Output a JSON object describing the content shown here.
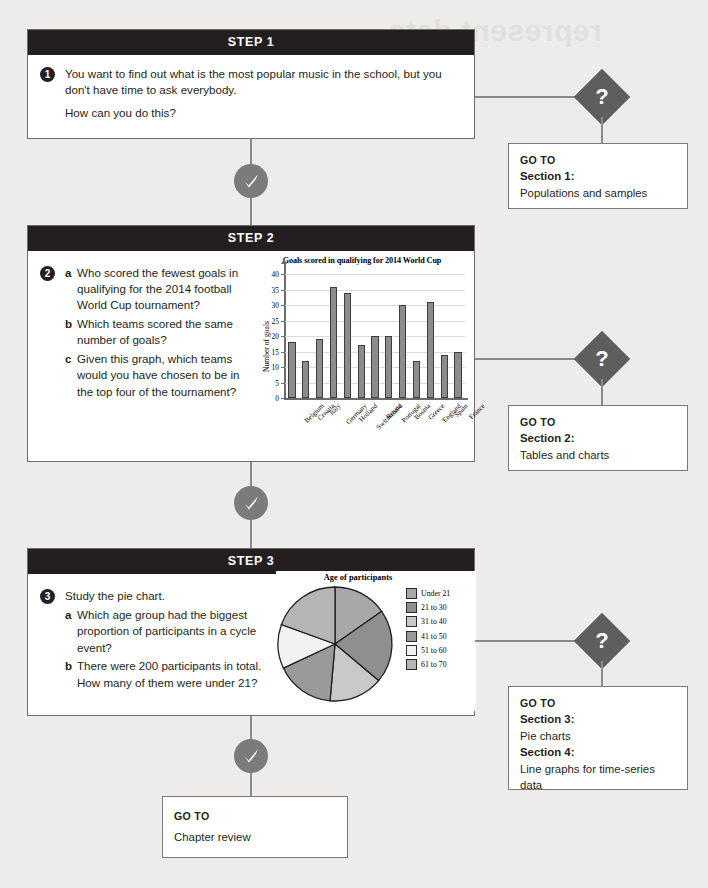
{
  "ghost": {
    "title": "represent data"
  },
  "steps": [
    {
      "header": "STEP 1",
      "number": "1",
      "paragraphs": [
        "You want to find out what is the most popular music in the school, but you don't have time to ask everybody.",
        "How can you do this?"
      ],
      "items": []
    },
    {
      "header": "STEP 2",
      "number": "2",
      "paragraphs": [],
      "items": [
        {
          "label": "a",
          "text": "Who scored the fewest goals in qualifying for the 2014 football World Cup tournament?"
        },
        {
          "label": "b",
          "text": "Which teams scored the same number of goals?"
        },
        {
          "label": "c",
          "text": "Given this graph, which teams would you have chosen to be in the top four of the tournament?"
        }
      ]
    },
    {
      "header": "STEP 3",
      "number": "3",
      "paragraphs": [
        "Study the pie chart."
      ],
      "items": [
        {
          "label": "a",
          "text": "Which age group had the biggest proportion of participants in a cycle event?"
        },
        {
          "label": "b",
          "text": "There were 200 participants in total. How many of them were under 21?"
        }
      ]
    }
  ],
  "goto_boxes": [
    {
      "label": "GO TO",
      "lines": [
        {
          "section": "Section 1:",
          "detail": "Populations and samples"
        }
      ]
    },
    {
      "label": "GO TO",
      "lines": [
        {
          "section": "Section 2:",
          "detail": "Tables and charts"
        }
      ]
    },
    {
      "label": "GO TO",
      "lines": [
        {
          "section": "Section 3:",
          "detail": "Pie charts"
        },
        {
          "section": "Section 4:",
          "detail": "Line graphs for time-series data"
        }
      ]
    }
  ],
  "final_box": {
    "label": "GO TO",
    "detail": "Chapter review"
  },
  "diamond_glyph": "?",
  "colors": {
    "page_bg": "#edecea",
    "header_bg": "#231f20",
    "check_circle": "#7b7b7b",
    "diamond": "#5e5e5e",
    "connector": "#8a8a8a",
    "bar_fill": "#8c8c8c",
    "bar_stroke": "#3d3d3d"
  },
  "chart_data": [
    {
      "type": "bar",
      "title": "Goals scored in qualifying for 2014 World Cup",
      "xlabel": "",
      "ylabel": "Number of goals",
      "categories": [
        "Belgium",
        "Croatia",
        "Italy",
        "Germany",
        "Holland",
        "Switzerland",
        "Russia",
        "Portugal",
        "Bosnia",
        "Greece",
        "England",
        "Spain",
        "France"
      ],
      "values": [
        18,
        12,
        19,
        36,
        34,
        17,
        20,
        20,
        30,
        12,
        31,
        14,
        15
      ],
      "yticks": [
        0,
        5,
        10,
        15,
        20,
        25,
        30,
        35,
        40
      ],
      "ylim": [
        0,
        42
      ],
      "grid": true,
      "legend": "none"
    },
    {
      "type": "pie",
      "title": "Age of participants",
      "labels": [
        "Under 21",
        "21 to 30",
        "31 to 40",
        "41 to 50",
        "51 to 60",
        "61 to 70"
      ],
      "values": [
        55,
        75,
        55,
        60,
        45,
        70
      ],
      "colors": [
        "#a8a8a8",
        "#8f8f8f",
        "#c9c9c9",
        "#9a9a9a",
        "#f2f2f2",
        "#b5b5b5"
      ],
      "legend": "right",
      "note": "There were 200 participants in total."
    }
  ]
}
